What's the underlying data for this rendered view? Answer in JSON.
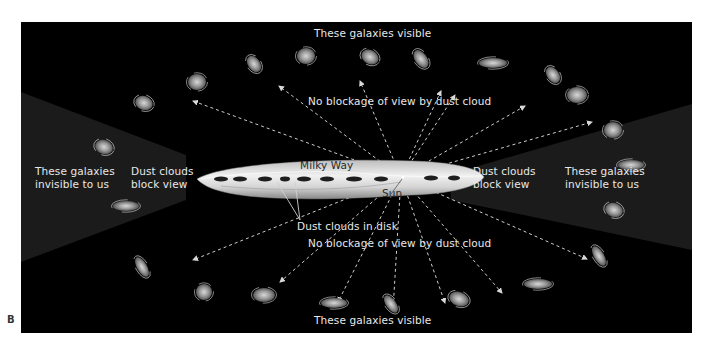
{
  "figure": {
    "panel_letter": "B",
    "background_color": "#000000",
    "dust_wedge_color": "#1c1c1c",
    "arrow_color": "#cfcfcf",
    "galaxy_color": "#9a9a9a"
  },
  "labels": {
    "top_visible": "These galaxies visible",
    "bottom_visible": "These galaxies visible",
    "no_blockage_top": "No blockage of view by dust cloud",
    "no_blockage_bottom": "No blockage of view by dust cloud",
    "left_invisible": "These galaxies\ninvisible to us",
    "right_invisible": "These galaxies\ninvisible to us",
    "left_dust": "Dust clouds\nblock view",
    "right_dust": "Dust clouds\nblock view",
    "milky_way": "Milky Way",
    "sun": "Sun",
    "dust_in_disk": "Dust clouds in disk"
  },
  "galaxies": [
    {
      "x": 144,
      "y": 81,
      "rx": 9,
      "ry": 7,
      "rot": 20
    },
    {
      "x": 197,
      "y": 60,
      "rx": 9,
      "ry": 8,
      "rot": 0
    },
    {
      "x": 254,
      "y": 42,
      "rx": 9,
      "ry": 6,
      "rot": 55
    },
    {
      "x": 306,
      "y": 34,
      "rx": 9,
      "ry": 8,
      "rot": 0
    },
    {
      "x": 370,
      "y": 35,
      "rx": 9,
      "ry": 7,
      "rot": 30
    },
    {
      "x": 421,
      "y": 37,
      "rx": 10,
      "ry": 6,
      "rot": 55
    },
    {
      "x": 493,
      "y": 41,
      "rx": 14,
      "ry": 5,
      "rot": 0
    },
    {
      "x": 553,
      "y": 53,
      "rx": 9,
      "ry": 6,
      "rot": 55
    },
    {
      "x": 577,
      "y": 73,
      "rx": 10,
      "ry": 8,
      "rot": 0
    },
    {
      "x": 104,
      "y": 125,
      "rx": 9,
      "ry": 7,
      "rot": 20
    },
    {
      "x": 126,
      "y": 184,
      "rx": 13,
      "ry": 5,
      "rot": 0
    },
    {
      "x": 613,
      "y": 108,
      "rx": 9,
      "ry": 8,
      "rot": 0
    },
    {
      "x": 631,
      "y": 143,
      "rx": 13,
      "ry": 5,
      "rot": 0
    },
    {
      "x": 614,
      "y": 188,
      "rx": 9,
      "ry": 7,
      "rot": 20
    },
    {
      "x": 142,
      "y": 245,
      "rx": 11,
      "ry": 5,
      "rot": 60
    },
    {
      "x": 204,
      "y": 270,
      "rx": 8,
      "ry": 8,
      "rot": 0
    },
    {
      "x": 264,
      "y": 273,
      "rx": 11,
      "ry": 7,
      "rot": 0
    },
    {
      "x": 334,
      "y": 281,
      "rx": 13,
      "ry": 5,
      "rot": 0
    },
    {
      "x": 391,
      "y": 282,
      "rx": 10,
      "ry": 5,
      "rot": 55
    },
    {
      "x": 459,
      "y": 277,
      "rx": 10,
      "ry": 7,
      "rot": 20
    },
    {
      "x": 538,
      "y": 262,
      "rx": 14,
      "ry": 5,
      "rot": 0
    },
    {
      "x": 599,
      "y": 234,
      "rx": 11,
      "ry": 5,
      "rot": 60
    }
  ],
  "arrows": [
    {
      "x2": 172,
      "y2": 79
    },
    {
      "x2": 258,
      "y2": 64
    },
    {
      "x2": 339,
      "y2": 59
    },
    {
      "x2": 420,
      "y2": 69
    },
    {
      "x2": 434,
      "y2": 73
    },
    {
      "x2": 504,
      "y2": 84
    },
    {
      "x2": 571,
      "y2": 100
    },
    {
      "x2": 172,
      "y2": 238
    },
    {
      "x2": 259,
      "y2": 260
    },
    {
      "x2": 317,
      "y2": 280
    },
    {
      "x2": 372,
      "y2": 288
    },
    {
      "x2": 424,
      "y2": 281
    },
    {
      "x2": 481,
      "y2": 271
    },
    {
      "x2": 566,
      "y2": 237
    }
  ]
}
